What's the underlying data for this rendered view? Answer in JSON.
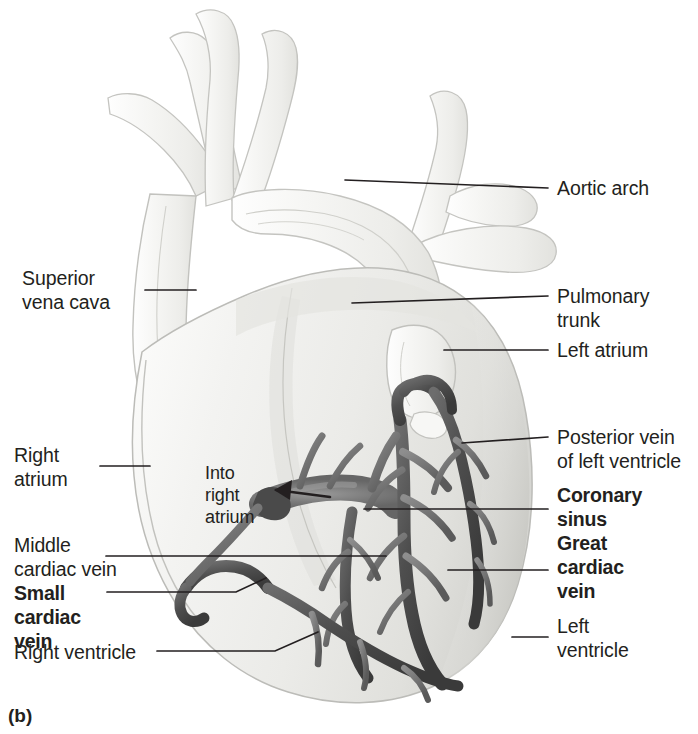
{
  "figure": {
    "caption": "(b)"
  },
  "labels": {
    "aortic_arch": "Aortic arch",
    "superior_vena_cava": "Superior\nvena cava",
    "pulmonary_trunk": "Pulmonary\ntrunk",
    "left_atrium": "Left atrium",
    "right_atrium": "Right\natrium",
    "posterior_vein_of_left_ventricle": "Posterior vein\nof left ventricle",
    "coronary_sinus": "Coronary\nsinus",
    "great_cardiac_vein": "Great\ncardiac\nvein",
    "middle_cardiac_vein": "Middle\ncardiac vein",
    "small_cardiac_vein": "Small\ncardiac\nvein",
    "left_ventricle": "Left\nventricle",
    "right_ventricle": "Right ventricle",
    "into_right_atrium": "Into\nright\natrium"
  },
  "colors": {
    "text": "#231f20",
    "leader_line": "#231f20",
    "heart_fill_light": "#f4f4f2",
    "heart_fill_mid": "#e6e6e3",
    "heart_shadow": "#c9c9c5",
    "vessel_outline": "#b9b9b5",
    "vein_dark": "#5a5a5a",
    "vein_darker": "#3f3f3f",
    "vein_mid": "#7d7d7d",
    "background": "#ffffff"
  },
  "structures": [
    {
      "name": "aortic arch",
      "kind": "great vessel"
    },
    {
      "name": "superior vena cava",
      "kind": "great vessel"
    },
    {
      "name": "pulmonary trunk",
      "kind": "great vessel"
    },
    {
      "name": "left atrium",
      "kind": "chamber"
    },
    {
      "name": "right atrium",
      "kind": "chamber"
    },
    {
      "name": "left ventricle",
      "kind": "chamber"
    },
    {
      "name": "right ventricle",
      "kind": "chamber"
    },
    {
      "name": "coronary sinus",
      "kind": "vein",
      "emphasis": "bold"
    },
    {
      "name": "great cardiac vein",
      "kind": "vein",
      "emphasis": "bold"
    },
    {
      "name": "small cardiac vein",
      "kind": "vein",
      "emphasis": "bold"
    },
    {
      "name": "middle cardiac vein",
      "kind": "vein"
    },
    {
      "name": "posterior vein of left ventricle",
      "kind": "vein"
    }
  ]
}
